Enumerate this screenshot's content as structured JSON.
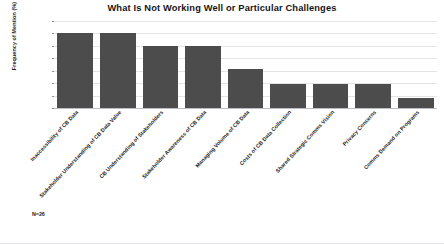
{
  "chart_data": {
    "type": "bar",
    "title": "What Is Not Working Well or Particular Challenges",
    "xlabel": "",
    "ylabel": "Frequency of Mention (%)",
    "ylim": [
      0,
      70
    ],
    "yticks": [
      0,
      10,
      20,
      30,
      40,
      50,
      60,
      70
    ],
    "grid": true,
    "legend": false,
    "bar_color": "#4c4c4c",
    "annotation": "N=26",
    "categories": [
      "Inaccessibility of CB Data",
      "Stakeholder Understanding of CB Data Value",
      "CB Understanding of Stakeholders",
      "Stakeholder Awareness of CB Data",
      "Managing Volume of CB Data",
      "Costs of CB Data Collection",
      "Shared Strategic Comms Vision",
      "Privacy Concerns",
      "Comms Demand on Programs"
    ],
    "values": [
      60,
      60,
      50,
      50,
      31,
      19,
      19,
      19,
      8
    ]
  }
}
